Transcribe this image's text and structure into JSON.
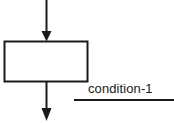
{
  "diagram": {
    "type": "flowchart-fragment",
    "title": "",
    "background_color": "#ffffff",
    "stroke_color": "#1a1a1a",
    "process_box": {
      "name": "process-box",
      "label": "",
      "fill_color": "#ffffff",
      "border_color": "#1a1a1a",
      "x": 4,
      "y": 41,
      "width": 84,
      "height": 41
    },
    "incoming_arrow": {
      "name": "incoming-flow-arrow",
      "direction": "down",
      "x": 46,
      "y_start": 0,
      "y_end": 41
    },
    "outgoing_arrow": {
      "name": "outgoing-flow-arrow",
      "direction": "down",
      "x": 46,
      "y_start": 82,
      "y_end": 121
    },
    "annotation": {
      "name": "condition-annotation",
      "text": "condition-1",
      "underline": {
        "x_start": 74,
        "x_end": 174,
        "y": 100
      }
    }
  }
}
